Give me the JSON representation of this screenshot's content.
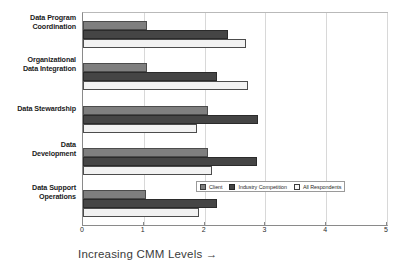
{
  "chart_data": {
    "type": "bar",
    "orientation": "horizontal",
    "title": "",
    "xlabel": "Increasing CMM Levels →",
    "ylabel": "",
    "xlim": [
      0,
      5
    ],
    "xticks": [
      "0",
      "1",
      "2",
      "3",
      "4",
      "5"
    ],
    "grid": true,
    "legend_position": "inside-lower-right",
    "categories": [
      "Data Program Coordination",
      "Organizational Data Integration",
      "Data Stewardship",
      "Data Development",
      "Data Support Operations"
    ],
    "category_lines": [
      [
        "Data Program",
        "Coordination"
      ],
      [
        "Organizational",
        "Data Integration"
      ],
      [
        "Data Stewardship"
      ],
      [
        "Data",
        "Development"
      ],
      [
        "Data Support",
        "Operations"
      ]
    ],
    "series": [
      {
        "name": "Client",
        "color": "#7f7f7f",
        "values": [
          1.05,
          1.05,
          2.05,
          2.05,
          1.03
        ]
      },
      {
        "name": "Industry Competition",
        "color": "#454545",
        "values": [
          2.38,
          2.2,
          2.88,
          2.86,
          2.2
        ]
      },
      {
        "name": "All Respondents",
        "color": "#f2f2f2",
        "values": [
          2.68,
          2.72,
          1.88,
          2.12,
          1.9
        ]
      }
    ]
  },
  "legend": {
    "entries": [
      {
        "label": "Client",
        "swatch": "client"
      },
      {
        "label": "Industry Competition",
        "swatch": "industry"
      },
      {
        "label": "All Respondents",
        "swatch": "all"
      }
    ]
  },
  "axis": {
    "x_title": "Increasing CMM Levels →"
  }
}
